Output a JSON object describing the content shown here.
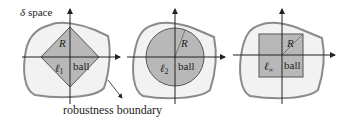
{
  "figure": {
    "space_label": "δ space",
    "space_symbol": "δ",
    "space_word": "space",
    "boundary_label": "robustness boundary",
    "colors": {
      "boundary_stroke": "#8a8a8a",
      "boundary_fill": "#f2f2f2",
      "ball_fill": "#b8b8b8",
      "ball_stroke": "#555555",
      "axis": "#222222"
    },
    "panels": [
      {
        "id": "l1",
        "ball_shape": "diamond",
        "norm_label": "ℓ",
        "norm_sub": "1",
        "ball_word": "ball",
        "radius_label": "R"
      },
      {
        "id": "l2",
        "ball_shape": "circle",
        "norm_label": "ℓ",
        "norm_sub": "2",
        "ball_word": "ball",
        "radius_label": "R"
      },
      {
        "id": "linf",
        "ball_shape": "square",
        "norm_label": "ℓ",
        "norm_sub": "∞",
        "ball_word": "ball",
        "radius_label": "R"
      }
    ]
  }
}
